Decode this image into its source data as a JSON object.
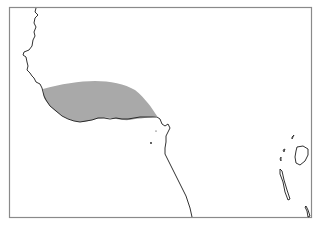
{
  "map": {
    "type": "range-map",
    "region": "West and Central Africa coastline",
    "frame": {
      "x": 9,
      "y": 7,
      "width": 302,
      "height": 210,
      "color": "#8a8a8a"
    },
    "coastline_color": "#1a1a1a",
    "range": {
      "label": "distribution range",
      "fill": "#a9a9a9"
    }
  }
}
